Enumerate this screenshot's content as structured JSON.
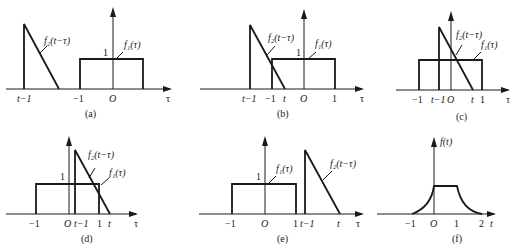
{
  "figure": {
    "panels": [
      {
        "id": "a",
        "caption": "(a)",
        "f2_label": "f₂(t−τ)",
        "f1_label": "f₁(τ)",
        "height_label": "1",
        "axis_label": "τ",
        "ticks": [
          "t−1",
          "−1",
          "O"
        ]
      },
      {
        "id": "b",
        "caption": "(b)",
        "f2_label": "f₂(t−τ)",
        "f1_label": "f₁(τ)",
        "height_label": "1",
        "axis_label": "τ",
        "ticks": [
          "t−1",
          "−1",
          "t",
          "O",
          "1"
        ]
      },
      {
        "id": "c",
        "caption": "(c)",
        "f2_label": "f₂(t−τ)",
        "f1_label": "f₁(τ)",
        "axis_label": "τ",
        "ticks": [
          "−1",
          "t−1",
          "O",
          "t",
          "1"
        ]
      },
      {
        "id": "d",
        "caption": "(d)",
        "f2_label": "f₂(t−τ)",
        "f1_label": "f₁(τ)",
        "height_label": "1",
        "axis_label": "τ",
        "ticks": [
          "−1",
          "O",
          "t−1",
          "1",
          "t"
        ]
      },
      {
        "id": "e",
        "caption": "(e)",
        "f2_label": "f₂(t−τ)",
        "f1_label": "f₁(τ)",
        "height_label": "1",
        "axis_label": "τ",
        "ticks": [
          "−1",
          "O",
          "1",
          "t−1",
          "t"
        ]
      },
      {
        "id": "f",
        "caption": "(f)",
        "y_label": "f(t)",
        "axis_label": "t",
        "ticks": [
          "−1",
          "O",
          "1",
          "2"
        ]
      }
    ]
  }
}
